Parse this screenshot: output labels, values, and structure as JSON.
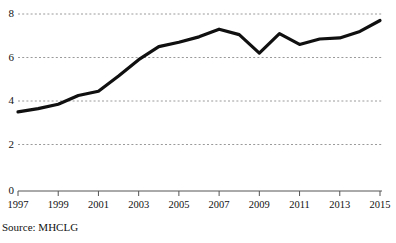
{
  "source_note": "Source: MHCLG",
  "axis": {
    "y_ticks": [
      "0",
      "2",
      "4",
      "6",
      "8"
    ],
    "x_ticks": [
      "1997",
      "1999",
      "2001",
      "2003",
      "2005",
      "2007",
      "2009",
      "2011",
      "2013",
      "2015"
    ]
  },
  "style": {
    "line_color": "#101010",
    "gridline_color": "#9a9a9a",
    "axis_color": "#555555",
    "background": "#ffffff"
  },
  "chart_data": {
    "type": "line",
    "title": "",
    "subtitle": "",
    "xlabel": "",
    "ylabel": "",
    "source": "Source: MHCLG",
    "grid": true,
    "legend": false,
    "legend_position": "none",
    "xlim": [
      1997,
      2015
    ],
    "ylim": [
      0,
      8
    ],
    "y_tick_values": [
      0,
      2,
      4,
      6,
      8
    ],
    "x_tick_values": [
      1997,
      1999,
      2001,
      2003,
      2005,
      2007,
      2009,
      2011,
      2013,
      2015
    ],
    "x": [
      1997,
      1998,
      1999,
      2000,
      2001,
      2002,
      2003,
      2004,
      2005,
      2006,
      2007,
      2008,
      2009,
      2010,
      2011,
      2012,
      2013,
      2014,
      2015
    ],
    "series": [
      {
        "name": "value",
        "values": [
          3.5,
          3.65,
          3.85,
          4.25,
          4.45,
          5.15,
          5.9,
          6.5,
          6.7,
          6.95,
          7.3,
          7.05,
          6.2,
          7.1,
          6.6,
          6.85,
          6.9,
          7.2,
          7.7
        ]
      }
    ]
  }
}
